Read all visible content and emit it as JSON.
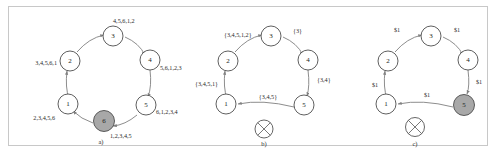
{
  "figure": {
    "panel_count": 3,
    "colors": {
      "node_fill": "#ffffff",
      "node_stroke": "#4d4d4d",
      "shaded_node_fill": "#a8a8a8",
      "edge_stroke": "#808080",
      "frame_border": "#c8c8c8",
      "text": "#222222"
    }
  },
  "panels": [
    {
      "id": "a",
      "caption": "a)",
      "nodes": [
        {
          "id": "n2",
          "label": "2",
          "shaded": false,
          "failed": false
        },
        {
          "id": "n3",
          "label": "3",
          "shaded": false,
          "failed": false
        },
        {
          "id": "n4",
          "label": "4",
          "shaded": false,
          "failed": false
        },
        {
          "id": "n5",
          "label": "5",
          "shaded": false,
          "failed": false
        },
        {
          "id": "n6",
          "label": "6",
          "shaded": true,
          "failed": false
        },
        {
          "id": "n1",
          "label": "1",
          "shaded": false,
          "failed": false
        }
      ],
      "edge_labels": [
        {
          "id": "e23",
          "text": "4,5,6,1,2"
        },
        {
          "id": "e34",
          "text": "5,6,1,2,3"
        },
        {
          "id": "e45",
          "text": "6,1,2,3,4"
        },
        {
          "id": "e56",
          "text": "1,2,3,4,5"
        },
        {
          "id": "e61",
          "text": "2,3,4,5,6"
        },
        {
          "id": "e12",
          "text": "3,4,5,6,1"
        }
      ],
      "has_failed_node": false
    },
    {
      "id": "b",
      "caption": "b)",
      "nodes": [
        {
          "id": "n2",
          "label": "2",
          "shaded": false,
          "failed": false
        },
        {
          "id": "n3",
          "label": "3",
          "shaded": false,
          "failed": false
        },
        {
          "id": "n4",
          "label": "4",
          "shaded": false,
          "failed": false
        },
        {
          "id": "n5",
          "label": "5",
          "shaded": false,
          "failed": false
        },
        {
          "id": "n1",
          "label": "1",
          "shaded": false,
          "failed": false
        }
      ],
      "edge_labels": [
        {
          "id": "e23",
          "text": "{3,4,5,1,2}"
        },
        {
          "id": "e34",
          "text": "{3}"
        },
        {
          "id": "e45",
          "text": "{3,4}"
        },
        {
          "id": "e51",
          "text": "{3,4,5}"
        },
        {
          "id": "e12",
          "text": "{3,4,5,1}"
        }
      ],
      "failed_node": {
        "label": "6",
        "crossed_out": true
      },
      "has_failed_node": true
    },
    {
      "id": "c",
      "caption": "c)",
      "nodes": [
        {
          "id": "n2",
          "label": "2",
          "shaded": false,
          "failed": false
        },
        {
          "id": "n3",
          "label": "3",
          "shaded": false,
          "failed": false
        },
        {
          "id": "n4",
          "label": "4",
          "shaded": false,
          "failed": false
        },
        {
          "id": "n5",
          "label": "5",
          "shaded": true,
          "failed": false
        },
        {
          "id": "n1",
          "label": "1",
          "shaded": false,
          "failed": false
        }
      ],
      "edge_labels": [
        {
          "id": "e23",
          "text": "$1"
        },
        {
          "id": "e34",
          "text": "$1"
        },
        {
          "id": "e45",
          "text": "$1"
        },
        {
          "id": "e51",
          "text": "$1"
        },
        {
          "id": "e12",
          "text": "$1"
        }
      ],
      "failed_node": {
        "label": "6",
        "crossed_out": true
      },
      "has_failed_node": true
    }
  ]
}
